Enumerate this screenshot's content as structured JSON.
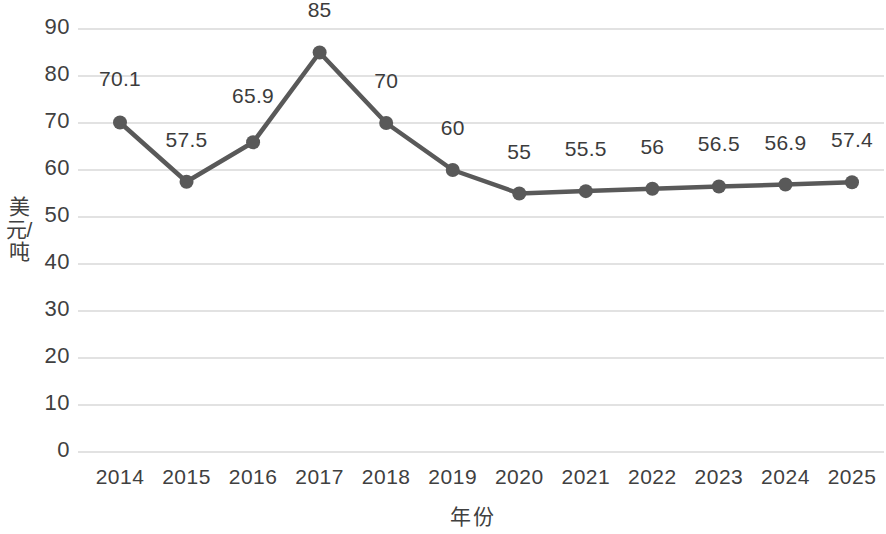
{
  "chart_data": {
    "type": "line",
    "title": "",
    "xlabel": "年份",
    "ylabel": "美元/吨",
    "categories": [
      "2014",
      "2015",
      "2016",
      "2017",
      "2018",
      "2019",
      "2020",
      "2021",
      "2022",
      "2023",
      "2024",
      "2025"
    ],
    "values": [
      70.1,
      57.5,
      65.9,
      85,
      70,
      60,
      55,
      55.5,
      56,
      56.5,
      56.9,
      57.4
    ],
    "point_labels": [
      "70.1",
      "57.5",
      "65.9",
      "85",
      "70",
      "60",
      "55",
      "55.5",
      "56",
      "56.5",
      "56.9",
      "57.4"
    ],
    "ylim": [
      0,
      90
    ],
    "ytick_labels": [
      "90",
      "80",
      "70",
      "60",
      "50",
      "40",
      "30",
      "20",
      "10",
      "0"
    ],
    "ytick_values": [
      90,
      80,
      70,
      60,
      50,
      40,
      30,
      20,
      10,
      0
    ],
    "grid": true,
    "legend": false,
    "series_color": "#595959",
    "grid_color": "#d9d9d9",
    "marker": "circle"
  }
}
